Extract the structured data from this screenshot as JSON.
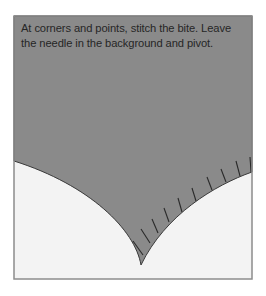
{
  "figure": {
    "caption": "At corners and points, stitch the bite. Leave the needle in the background and pivot.",
    "colors": {
      "fabric": "#8a8a8a",
      "background": "#f3f3f3",
      "frame": "#8c8c8c",
      "stitch": "#2a2a2a"
    }
  }
}
